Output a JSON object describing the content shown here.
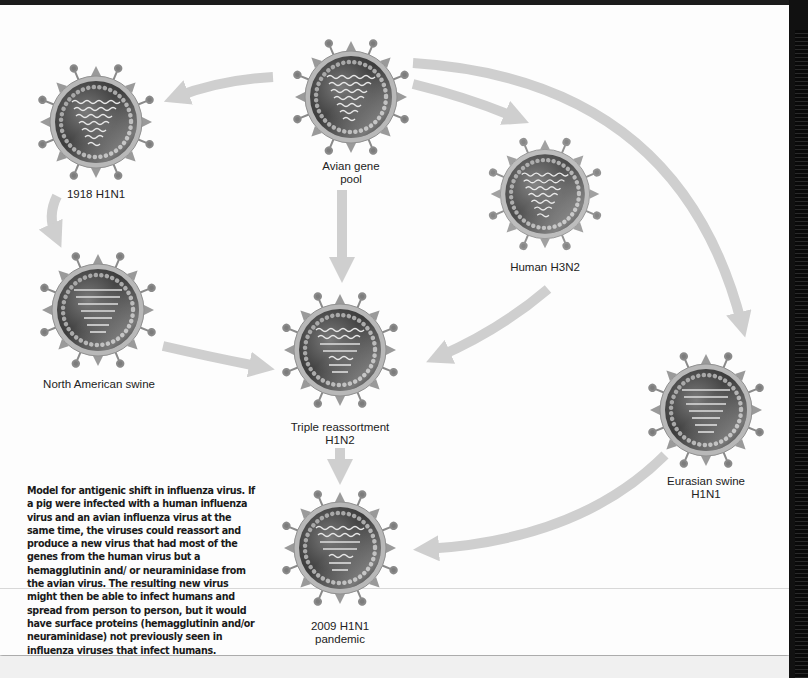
{
  "diagram": {
    "title": "Model for antigenic shift in influenza virus",
    "nodes": [
      {
        "id": "avian",
        "label_line1": "Avian gene",
        "label_line2": "pool",
        "genome": "wavy"
      },
      {
        "id": "h1n1_1918",
        "label_line1": "1918 H1N1",
        "label_line2": "",
        "genome": "wavy"
      },
      {
        "id": "human_h3n2",
        "label_line1": "Human H3N2",
        "label_line2": "",
        "genome": "wavy"
      },
      {
        "id": "na_swine",
        "label_line1": "North American swine",
        "label_line2": "",
        "genome": "straight"
      },
      {
        "id": "triple",
        "label_line1": "Triple reassortment",
        "label_line2": "H1N2",
        "genome": "mixed"
      },
      {
        "id": "eurasian",
        "label_line1": "Eurasian swine",
        "label_line2": "H1N1",
        "genome": "straight"
      },
      {
        "id": "pandemic_2009",
        "label_line1": "2009 H1N1",
        "label_line2": "pandemic",
        "genome": "mixed"
      }
    ],
    "edges": [
      {
        "from": "avian",
        "to": "h1n1_1918"
      },
      {
        "from": "avian",
        "to": "human_h3n2"
      },
      {
        "from": "avian",
        "to": "eurasian"
      },
      {
        "from": "avian",
        "to": "triple"
      },
      {
        "from": "h1n1_1918",
        "to": "na_swine"
      },
      {
        "from": "na_swine",
        "to": "triple"
      },
      {
        "from": "human_h3n2",
        "to": "triple"
      },
      {
        "from": "triple",
        "to": "pandemic_2009"
      },
      {
        "from": "eurasian",
        "to": "pandemic_2009"
      }
    ],
    "caption": "Model for antigenic shift in influenza virus. If a pig were infected with a human influenza virus and an avian influenza virus at the same time, the viruses could reassort and produce a new virus that had most of the genes from the human virus but a hemagglutinin and/ or neuraminidase from the avian virus. The resulting new virus might then be able to infect humans and spread from person to person, but it would have surface proteins (hemagglutinin and/or neuraminidase) not previously seen in influenza viruses that infect humans."
  },
  "colors": {
    "arrow": "#cfcfcf",
    "virus_core": "#4a4a4a",
    "virus_shell": "#b5b5b5",
    "text": "#222222"
  }
}
